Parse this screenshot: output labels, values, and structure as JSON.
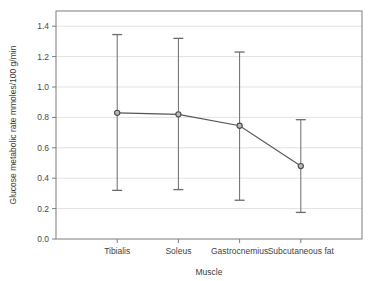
{
  "chart_data": {
    "type": "line",
    "title": "",
    "xlabel": "Muscle",
    "ylabel": "Glucose metabolic rate mmoles/100 g/min",
    "categories": [
      "Tibialis",
      "Soleus",
      "Gastrocnemius",
      "Subcutaneous fat"
    ],
    "values": [
      0.83,
      0.82,
      0.745,
      0.48
    ],
    "error_low": [
      0.32,
      0.325,
      0.255,
      0.175
    ],
    "error_high": [
      1.345,
      1.32,
      1.23,
      0.785
    ],
    "ylim": [
      0.0,
      1.5
    ],
    "yticks": [
      0.0,
      0.2,
      0.4,
      0.6,
      0.8,
      1.0,
      1.2,
      1.4
    ],
    "ytick_labels": [
      "0.0",
      "0.2",
      "0.4",
      "0.6",
      "0.8",
      "1.0",
      "1.2",
      "1.4"
    ],
    "grid": true,
    "grid_axis": "y",
    "legend": "none",
    "marker": "open-circle",
    "series_name": "Glucose metabolic rate",
    "colors": {
      "line": "#555555",
      "marker_edge": "#4a4a4a",
      "marker_face": "#b9b9b9",
      "error_bar": "#6b6b6b",
      "grid": "#e2e2e2",
      "frame": "#7d7d7d",
      "background": "#ffffff",
      "text": "#3a3a3a"
    }
  }
}
